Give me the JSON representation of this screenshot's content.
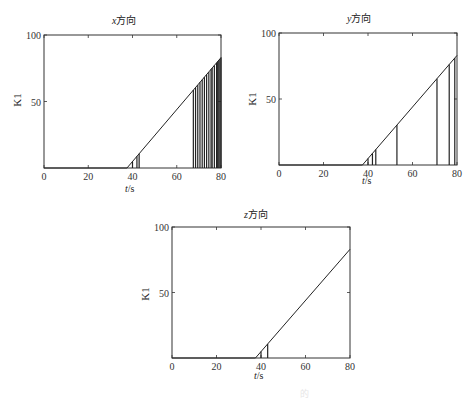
{
  "chart_data": [
    {
      "type": "line",
      "title": "x方向",
      "title_var": "x",
      "title_suffix": "方向",
      "xlabel": "t/s",
      "ylabel": "K1",
      "xlim": [
        0,
        80
      ],
      "ylim": [
        0,
        100
      ],
      "xticks": [
        0,
        20,
        40,
        60,
        80
      ],
      "yticks": [
        50,
        100
      ],
      "yticklabels_shown": [
        "100",
        "50"
      ],
      "series": [
        {
          "name": "K1 ramp",
          "x": [
            0,
            37.5,
            80
          ],
          "y": [
            0,
            0,
            83
          ]
        },
        {
          "name": "vertical events",
          "x": [
            40,
            42,
            43,
            67.5,
            68.5,
            69.5,
            70.5,
            71.5,
            72.5,
            73.5,
            74.5,
            75.5,
            76,
            77,
            78,
            78.5,
            79,
            79.5,
            80
          ],
          "y_from_ramp": true
        }
      ],
      "grid": false
    },
    {
      "type": "line",
      "title": "y方向",
      "title_var": "y",
      "title_suffix": "方向",
      "xlabel": "t/s",
      "ylabel": "K1",
      "xlim": [
        0,
        80
      ],
      "ylim": [
        0,
        100
      ],
      "xticks": [
        0,
        20,
        40,
        60,
        80
      ],
      "yticks": [
        50,
        100
      ],
      "series": [
        {
          "name": "K1 ramp",
          "x": [
            0,
            37.5,
            80
          ],
          "y": [
            0,
            0,
            83
          ]
        },
        {
          "name": "vertical events",
          "x": [
            40,
            42,
            43.5,
            53,
            71,
            76.5,
            79
          ],
          "y_from_ramp": true
        }
      ],
      "grid": false
    },
    {
      "type": "line",
      "title": "z方向",
      "title_var": "z",
      "title_suffix": "方向",
      "xlabel": "t/s",
      "ylabel": "K1",
      "xlim": [
        0,
        80
      ],
      "ylim": [
        0,
        100
      ],
      "xticks": [
        0,
        20,
        40,
        60,
        80
      ],
      "yticks": [
        50,
        100
      ],
      "series": [
        {
          "name": "K1 ramp",
          "x": [
            0,
            37.5,
            80
          ],
          "y": [
            0,
            0,
            83
          ]
        },
        {
          "name": "vertical events",
          "x": [
            40,
            43
          ],
          "y_from_ramp": true
        }
      ],
      "grid": false
    }
  ],
  "caption": "的"
}
